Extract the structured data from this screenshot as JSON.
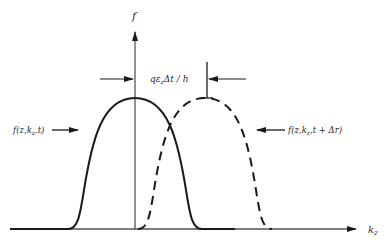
{
  "diagram": {
    "y_axis_label": "f",
    "x_axis_label": "k",
    "x_axis_label_sub": "z",
    "shift_label": "qε",
    "shift_label_sub": "z",
    "shift_label_rest": "Δt / h",
    "curve_solid_label": "f(z,k",
    "curve_solid_label_sub": "z",
    "curve_solid_label_rest": ",t)",
    "curve_dashed_label": "f(z,k",
    "curve_dashed_label_sub": "z",
    "curve_dashed_label_rest": ",t + Δr)",
    "colors": {
      "ink": "#1a1a1a",
      "axis": "#555555",
      "background": "#ffffff"
    }
  }
}
